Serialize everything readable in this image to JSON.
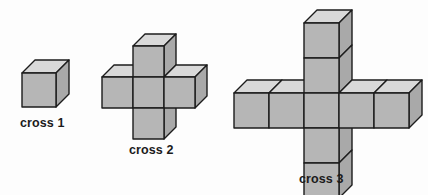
{
  "page": {
    "background_color": "#fdfdfd"
  },
  "style": {
    "face_top_color": "#d9d9d9",
    "face_front_color": "#b6b6b6",
    "face_right_color": "#a9a9a9",
    "outline_color": "#1c1c1c",
    "outline_width": 1.4,
    "caption_color": "#1b1b1b"
  },
  "figures": [
    {
      "id": "cross-1",
      "caption": "cross 1",
      "cube_count": 1,
      "arm_length": 0,
      "cell_size": 34,
      "depth": 13,
      "cells": [
        {
          "col": 0,
          "row": 0
        }
      ]
    },
    {
      "id": "cross-2",
      "caption": "cross 2",
      "cube_count": 5,
      "arm_length": 1,
      "cell_size": 31,
      "depth": 12,
      "cells": [
        {
          "col": 0,
          "row": -1
        },
        {
          "col": -1,
          "row": 0
        },
        {
          "col": 0,
          "row": 0
        },
        {
          "col": 1,
          "row": 0
        },
        {
          "col": 0,
          "row": 1
        }
      ]
    },
    {
      "id": "cross-3",
      "caption": "cross 3",
      "cube_count": 9,
      "arm_length": 2,
      "cell_size": 35,
      "depth": 13,
      "cells": [
        {
          "col": 0,
          "row": -2
        },
        {
          "col": 0,
          "row": -1
        },
        {
          "col": -2,
          "row": 0
        },
        {
          "col": -1,
          "row": 0
        },
        {
          "col": 0,
          "row": 0
        },
        {
          "col": 1,
          "row": 0
        },
        {
          "col": 2,
          "row": 0
        },
        {
          "col": 0,
          "row": 1
        },
        {
          "col": 0,
          "row": 2
        }
      ]
    }
  ]
}
